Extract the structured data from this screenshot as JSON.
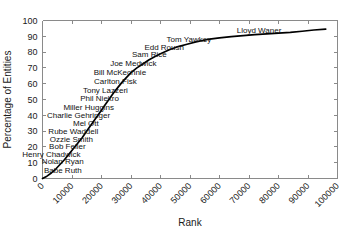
{
  "chart_data": {
    "type": "line",
    "title": "",
    "xlabel": "Rank",
    "ylabel": "Percentage of Entities",
    "xlim": [
      0,
      100000
    ],
    "ylim": [
      0,
      100
    ],
    "xticks": [
      0,
      10000,
      20000,
      30000,
      40000,
      50000,
      60000,
      70000,
      80000,
      90000,
      100000
    ],
    "xtick_labels": [
      "0",
      "10000",
      "20000",
      "30000",
      "40000",
      "50000",
      "60000",
      "70000",
      "80000",
      "90000",
      "100000"
    ],
    "yticks": [
      0,
      10,
      20,
      30,
      40,
      50,
      60,
      70,
      80,
      90,
      100
    ],
    "ytick_labels": [
      "0",
      "10",
      "20",
      "30",
      "40",
      "50",
      "60",
      "70",
      "80",
      "90",
      "100"
    ],
    "grid": false,
    "legend": false,
    "series": [
      {
        "name": "cumulative-percentage",
        "color": "#000000",
        "x": [
          0,
          1500,
          3000,
          4500,
          6000,
          7500,
          9000,
          10500,
          12000,
          13500,
          15000,
          16500,
          18000,
          19500,
          21000,
          22500,
          24000,
          25500,
          27000,
          28500,
          30000,
          32000,
          34000,
          36000,
          38000,
          40000,
          43000,
          46000,
          49000,
          52000,
          56000,
          60000,
          64000,
          68000,
          72000,
          76000,
          80000,
          84000,
          88000,
          92000,
          96000
        ],
        "y": [
          0,
          1.5,
          3.5,
          6,
          9,
          12,
          15.5,
          19,
          22.5,
          26,
          30,
          34,
          38,
          42,
          46,
          50,
          54,
          57.5,
          61,
          64,
          67,
          70,
          72.5,
          75,
          77,
          79,
          81.5,
          83.5,
          85,
          86.5,
          88,
          89,
          89.8,
          90.4,
          91,
          91.5,
          92,
          92.5,
          93.2,
          94,
          94.6
        ]
      }
    ],
    "annotations": [
      {
        "label": "Lloyd Waner",
        "x": 62000,
        "y": 91.0,
        "anchor": "right",
        "dx": 56,
        "dy": -2
      },
      {
        "label": "Tom Yawkey",
        "x": 47000,
        "y": 84.5,
        "anchor": "right",
        "dx": 30,
        "dy": -3
      },
      {
        "label": "Edd Roush",
        "x": 40500,
        "y": 79.5,
        "anchor": "right",
        "dx": 22,
        "dy": -3
      },
      {
        "label": "Sam Rice",
        "x": 36000,
        "y": 75.0,
        "anchor": "right",
        "dx": 18,
        "dy": -3
      },
      {
        "label": "Joe Medwick",
        "x": 31500,
        "y": 69.0,
        "anchor": "right",
        "dx": 21,
        "dy": -3
      },
      {
        "label": "Bill McKechnie",
        "x": 28000,
        "y": 63.5,
        "anchor": "right",
        "dx": 21,
        "dy": -3
      },
      {
        "label": "Carlton Fisk",
        "x": 25500,
        "y": 58.0,
        "anchor": "right",
        "dx": 19,
        "dy": -3
      },
      {
        "label": "Tony Lazzeri",
        "x": 22500,
        "y": 52.0,
        "anchor": "right",
        "dx": 19,
        "dy": -3
      },
      {
        "label": "Phil Niekro",
        "x": 20500,
        "y": 47.0,
        "anchor": "right",
        "dx": 16,
        "dy": -3
      },
      {
        "label": "Miller Huggins",
        "x": 18500,
        "y": 41.5,
        "anchor": "right",
        "dx": 17,
        "dy": -3
      },
      {
        "label": "Charlie Gehringer",
        "x": 16800,
        "y": 36.5,
        "anchor": "right",
        "dx": 18,
        "dy": -3
      },
      {
        "label": "Mel Ott",
        "x": 15000,
        "y": 31.5,
        "anchor": "right",
        "dx": 12,
        "dy": -3
      },
      {
        "label": "Rube Waddell",
        "x": 13500,
        "y": 26.5,
        "anchor": "right",
        "dx": 16,
        "dy": -3
      },
      {
        "label": "Ozzie Smith",
        "x": 12000,
        "y": 21.5,
        "anchor": "right",
        "dx": 15,
        "dy": -3
      },
      {
        "label": "Bob Feller",
        "x": 10200,
        "y": 16.5,
        "anchor": "right",
        "dx": 13,
        "dy": -3
      },
      {
        "label": "Henry Chadwick",
        "x": 8500,
        "y": 12.0,
        "anchor": "right",
        "dx": 13,
        "dy": -3
      },
      {
        "label": "Nolan Ryan",
        "x": 6500,
        "y": 7.0,
        "anchor": "right",
        "dx": 22,
        "dy": -3
      },
      {
        "label": "Babe Ruth",
        "x": 4500,
        "y": 2.0,
        "anchor": "right",
        "dx": 26,
        "dy": -2
      }
    ]
  }
}
